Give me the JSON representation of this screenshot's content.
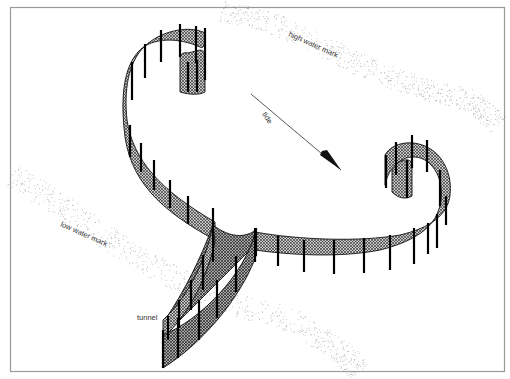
{
  "diagram": {
    "labels": {
      "high_water_mark": "high water mark",
      "low_water_mark": "low water mark",
      "tide": "tide",
      "tunnel": "tunnel"
    },
    "colors": {
      "frame": "#9a9a9a",
      "mesh_fill": "#bdbdbd",
      "mesh_hatch": "#1a1a1a",
      "post": "#000000",
      "water_mark_dots": "#8f8f8f",
      "text": "#333333"
    },
    "tide_direction": "top-left to bottom-right",
    "structures": [
      {
        "name": "left spiral arm",
        "curl": "upper-left hook"
      },
      {
        "name": "right spiral arm",
        "curl": "right hook"
      },
      {
        "name": "tunnel",
        "position": "bottom-center, leading toward low water mark"
      }
    ]
  }
}
